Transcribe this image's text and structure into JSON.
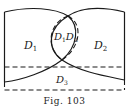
{
  "figure": {
    "caption": "Fig. 103",
    "regions": [
      {
        "id": "D1",
        "letter": "D",
        "subscript": "1"
      },
      {
        "id": "D1D2",
        "parts": [
          {
            "letter": "D",
            "subscript": "1"
          },
          {
            "letter": "D",
            "subscript": "2"
          }
        ]
      },
      {
        "id": "D2",
        "letter": "D",
        "subscript": "2"
      },
      {
        "id": "D3",
        "letter": "D",
        "subscript": "3"
      }
    ],
    "colors": {
      "stroke": "#1a1a1a",
      "background": "#ffffff"
    }
  }
}
